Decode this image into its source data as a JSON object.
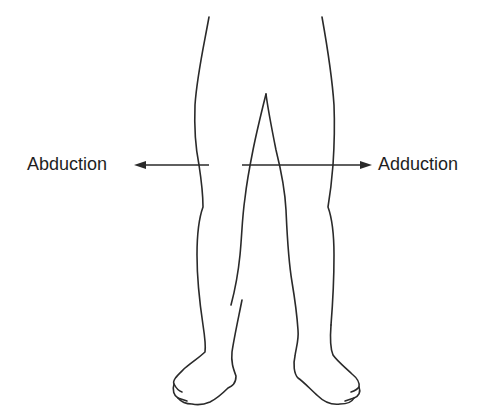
{
  "diagram": {
    "title": "",
    "labels": {
      "left": "Abduction",
      "right": "Adduction"
    },
    "arrows": [
      {
        "name": "abduction-arrow",
        "direction": "left"
      },
      {
        "name": "adduction-arrow",
        "direction": "right"
      }
    ],
    "colors": {
      "line": "#2a2a2a",
      "background": "#ffffff",
      "text": "#1e1e1e"
    }
  }
}
